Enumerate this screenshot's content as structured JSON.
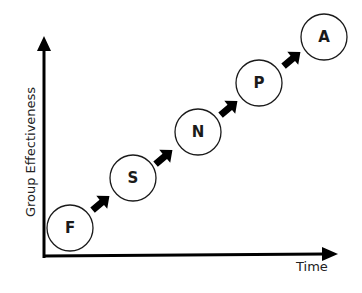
{
  "diagram": {
    "type": "staged-progression",
    "axes": {
      "x_label": "Time",
      "y_label": "Group Effectiveness"
    },
    "stages": [
      {
        "label": "F",
        "cx": 70,
        "cy": 228
      },
      {
        "label": "S",
        "cx": 133,
        "cy": 178
      },
      {
        "label": "N",
        "cx": 198,
        "cy": 132
      },
      {
        "label": "P",
        "cx": 259,
        "cy": 83
      },
      {
        "label": "A",
        "cx": 324,
        "cy": 37
      }
    ],
    "connectors": [
      {
        "from": "F",
        "to": "S",
        "x": 101,
        "y": 203
      },
      {
        "from": "S",
        "to": "N",
        "x": 164,
        "y": 157
      },
      {
        "from": "N",
        "to": "P",
        "x": 229,
        "y": 108
      },
      {
        "from": "P",
        "to": "A",
        "x": 292,
        "y": 59
      }
    ],
    "colors": {
      "stroke": "#1a1a1a",
      "fill": "#ffffff",
      "arrow": "#000000"
    }
  }
}
